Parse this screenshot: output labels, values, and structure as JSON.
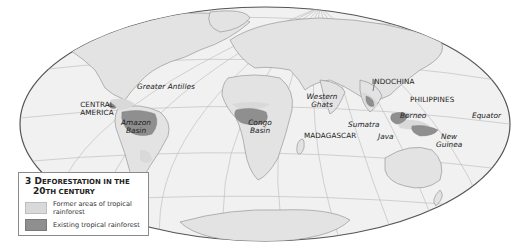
{
  "map": {
    "projection": "elliptical world projection",
    "colors": {
      "background": "#ffffff",
      "ocean": "#f1f1f1",
      "former_rainforest": "#d9d9d9",
      "existing_rainforest": "#8f8f8f",
      "land": "#e3e3e3",
      "graticule": "#b8b8b8",
      "outline": "#555555",
      "coast": "#8a8a8a"
    },
    "labels": [
      {
        "id": "greater-antilles",
        "text": "Greater Antilles",
        "style": "italic"
      },
      {
        "id": "central-america-1",
        "text": "CENTRAL",
        "style": "caps"
      },
      {
        "id": "central-america-2",
        "text": "AMERICA",
        "style": "caps"
      },
      {
        "id": "amazon-1",
        "text": "Amazon",
        "style": "italic"
      },
      {
        "id": "amazon-2",
        "text": "Basin",
        "style": "italic"
      },
      {
        "id": "congo-1",
        "text": "Congo",
        "style": "italic"
      },
      {
        "id": "congo-2",
        "text": "Basin",
        "style": "italic"
      },
      {
        "id": "western-ghats-1",
        "text": "Western",
        "style": "italic"
      },
      {
        "id": "western-ghats-2",
        "text": "Ghats",
        "style": "italic"
      },
      {
        "id": "madagascar",
        "text": "MADAGASCAR",
        "style": "caps"
      },
      {
        "id": "sumatra",
        "text": "Sumatra",
        "style": "italic"
      },
      {
        "id": "java",
        "text": "Java",
        "style": "italic"
      },
      {
        "id": "indochina",
        "text": "INDOCHINA",
        "style": "caps"
      },
      {
        "id": "philippines",
        "text": "PHILIPPINES",
        "style": "caps"
      },
      {
        "id": "borneo",
        "text": "Borneo",
        "style": "italic"
      },
      {
        "id": "new-guinea-1",
        "text": "New",
        "style": "italic"
      },
      {
        "id": "new-guinea-2",
        "text": "Guinea",
        "style": "italic"
      },
      {
        "id": "equator",
        "text": "Equator",
        "style": "italic"
      }
    ]
  },
  "legend": {
    "number": "3",
    "title_line1_first": "D",
    "title_line1_rest": "EFORESTATION IN THE",
    "title_line2_first": "20",
    "title_line2_rest": "TH CENTURY",
    "items": [
      {
        "label": "Former areas of tropical rainforest",
        "color": "#d9d9d9"
      },
      {
        "label": "Existing tropical rainforest",
        "color": "#8f8f8f"
      }
    ]
  }
}
